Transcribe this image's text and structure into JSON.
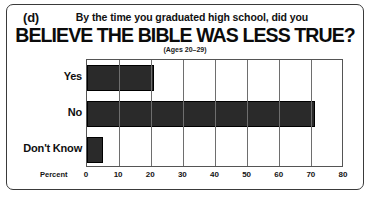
{
  "figure": {
    "panel_letter": "(d)",
    "kicker": "By the time you graduated high school, did you",
    "main_title": "BELIEVE THE BIBLE WAS LESS TRUE?",
    "sub_note": "(Ages 20–29)",
    "frame_color": "#3a3a3a",
    "background_color": "#ffffff"
  },
  "chart_data": {
    "type": "bar",
    "orientation": "horizontal",
    "title": "BELIEVE THE BIBLE WAS LESS TRUE?",
    "subtitle": "By the time you graduated high school, did you",
    "annotation": "(Ages 20–29)",
    "categories": [
      "Yes",
      "No",
      "Don't Know"
    ],
    "values": [
      21,
      71,
      5
    ],
    "xlabel": "Percent",
    "ylabel": "",
    "xlim": [
      0,
      80
    ],
    "xticks": [
      0,
      10,
      20,
      30,
      40,
      50,
      60,
      70,
      80
    ],
    "xtick_labels": [
      "0",
      "10",
      "20",
      "30",
      "40",
      "50",
      "60",
      "70",
      "80"
    ],
    "grid": true,
    "grid_axis": "x",
    "legend": false,
    "bar_color": "#2a2a2a",
    "bar_edge_color": "#000000",
    "grid_color": "#6e6e6e"
  }
}
